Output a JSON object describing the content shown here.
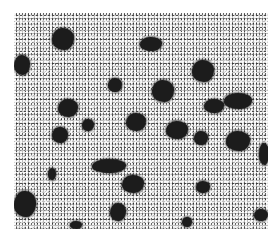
{
  "image": {
    "description": "Grayscale halftone micrograph showing dark irregular particles/inclusions scattered on a speckled light-gray matrix",
    "background_color": "#ffffff",
    "matrix_color": "#bdbdbd",
    "particle_color": "#1c1c1c",
    "frame": {
      "x": 14,
      "y": 13,
      "width": 254,
      "height": 216
    },
    "blobs": [
      {
        "x": 38,
        "y": 15,
        "w": 22,
        "h": 22
      },
      {
        "x": 126,
        "y": 24,
        "w": 22,
        "h": 14
      },
      {
        "x": 0,
        "y": 42,
        "w": 16,
        "h": 20
      },
      {
        "x": 178,
        "y": 47,
        "w": 22,
        "h": 22
      },
      {
        "x": 94,
        "y": 65,
        "w": 14,
        "h": 14
      },
      {
        "x": 138,
        "y": 67,
        "w": 22,
        "h": 22
      },
      {
        "x": 190,
        "y": 86,
        "w": 20,
        "h": 14
      },
      {
        "x": 210,
        "y": 80,
        "w": 28,
        "h": 16
      },
      {
        "x": 44,
        "y": 86,
        "w": 20,
        "h": 18
      },
      {
        "x": 112,
        "y": 100,
        "w": 20,
        "h": 18
      },
      {
        "x": 68,
        "y": 106,
        "w": 12,
        "h": 12
      },
      {
        "x": 38,
        "y": 114,
        "w": 16,
        "h": 16
      },
      {
        "x": 152,
        "y": 108,
        "w": 22,
        "h": 18
      },
      {
        "x": 180,
        "y": 118,
        "w": 14,
        "h": 14
      },
      {
        "x": 212,
        "y": 118,
        "w": 24,
        "h": 20
      },
      {
        "x": 245,
        "y": 130,
        "w": 10,
        "h": 22
      },
      {
        "x": 78,
        "y": 146,
        "w": 34,
        "h": 14
      },
      {
        "x": 34,
        "y": 155,
        "w": 8,
        "h": 12
      },
      {
        "x": 108,
        "y": 162,
        "w": 22,
        "h": 18
      },
      {
        "x": 182,
        "y": 168,
        "w": 14,
        "h": 12
      },
      {
        "x": 0,
        "y": 178,
        "w": 22,
        "h": 26
      },
      {
        "x": 96,
        "y": 190,
        "w": 16,
        "h": 18
      },
      {
        "x": 168,
        "y": 204,
        "w": 10,
        "h": 10
      },
      {
        "x": 240,
        "y": 196,
        "w": 14,
        "h": 12
      },
      {
        "x": 56,
        "y": 208,
        "w": 12,
        "h": 8
      }
    ]
  }
}
